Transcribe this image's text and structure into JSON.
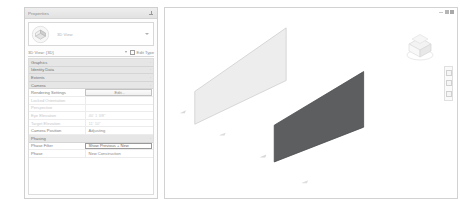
{
  "palette": {
    "title": "Properties",
    "pin_icon": "pin-icon",
    "type_selector": {
      "icon": "3d-view-thumbnail-icon",
      "label": "3D View",
      "caret_icon": "chevron-down-icon"
    },
    "view_bar": {
      "view_name": "3D View: {3D}",
      "caret_icon": "chevron-down-icon",
      "edit_type_icon": "edit-type-icon",
      "edit_type_label": "Edit Type"
    },
    "rows": [
      {
        "type": "group",
        "key": "Graphics",
        "value": "",
        "toggle": "·"
      },
      {
        "type": "group",
        "key": "Identity Data",
        "value": "",
        "toggle": "·"
      },
      {
        "type": "group",
        "key": "Extents",
        "value": "",
        "toggle": "·"
      },
      {
        "type": "group",
        "key": "Camera",
        "value": "",
        "toggle": "·"
      },
      {
        "type": "row",
        "key": "Rendering Settings",
        "value": "Edit...",
        "style": "button"
      },
      {
        "type": "row",
        "key": "Locked Orientation",
        "value": "",
        "style": "dim"
      },
      {
        "type": "row",
        "key": "Perspective",
        "value": "",
        "style": "dim"
      },
      {
        "type": "row",
        "key": "Eye Elevation",
        "value": "40' 1 3/8\"",
        "style": "dim"
      },
      {
        "type": "row",
        "key": "Target Elevation",
        "value": "11' 10\"",
        "style": "dim"
      },
      {
        "type": "row",
        "key": "Camera Position",
        "value": "Adjusting",
        "style": "normal"
      },
      {
        "type": "group",
        "key": "Phasing",
        "value": "",
        "toggle": "·"
      },
      {
        "type": "row",
        "key": "Phase Filter",
        "value": "Show Previous + New",
        "style": "selected"
      },
      {
        "type": "row",
        "key": "Phase",
        "value": "New Construction",
        "style": "normal"
      }
    ]
  },
  "canvas": {
    "window_controls": {
      "minimize": "minimize-icon",
      "maximize": "maximize-icon",
      "close": "close-icon"
    },
    "viewcube": {
      "name": "view-cube",
      "top_face_label": "TOP"
    },
    "navbar": {
      "buttons": [
        "steering-wheel-icon",
        "zoom-icon",
        "pan-icon"
      ]
    },
    "colors": {
      "wall_light_fill": "#ededed",
      "wall_light_stroke": "#cfcfcf",
      "wall_dark_fill": "#5c5e60",
      "wall_dark_stroke": "#4a4c4e",
      "marker": "#d5d5d5",
      "background": "#ffffff"
    },
    "elements": [
      {
        "name": "wall-light",
        "kind": "wall",
        "shade": "light"
      },
      {
        "name": "wall-dark",
        "kind": "wall",
        "shade": "dark"
      },
      {
        "name": "level-marker-1",
        "kind": "marker"
      },
      {
        "name": "level-marker-2",
        "kind": "marker"
      },
      {
        "name": "level-marker-3",
        "kind": "marker"
      },
      {
        "name": "level-marker-4",
        "kind": "marker"
      }
    ]
  }
}
